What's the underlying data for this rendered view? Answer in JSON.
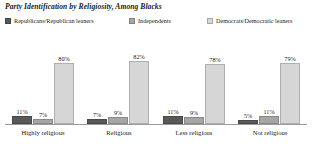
{
  "chart_data": {
    "type": "bar",
    "title": "Party Identification by Religiosity, Among Blacks",
    "xlabel": "",
    "ylabel": "",
    "ylim": [
      0,
      100
    ],
    "grid": false,
    "legend_position": "top",
    "categories": [
      "Highly religious",
      "Religious",
      "Less religious",
      "Not religious"
    ],
    "series": [
      {
        "name": "Republicans/Republican leaners",
        "color": "#595959",
        "values": [
          11,
          7,
          11,
          5
        ],
        "labels": [
          "11%",
          "7%",
          "11%",
          "5%"
        ]
      },
      {
        "name": "Independents",
        "color": "#a6a6a6",
        "values": [
          7,
          9,
          9,
          11
        ],
        "labels": [
          "7%",
          "9%",
          "9%",
          "11%"
        ]
      },
      {
        "name": "Democrats/Democratic leaners",
        "color": "#d6d6d6",
        "values": [
          80,
          82,
          78,
          79
        ],
        "labels": [
          "80%",
          "82%",
          "78%",
          "79%"
        ]
      }
    ]
  },
  "legend": {
    "items": [
      {
        "label": "Republicans/Republican leaners",
        "color": "#595959"
      },
      {
        "label": "Independents",
        "color": "#a6a6a6"
      },
      {
        "label": "Democrats/Democratic leaners",
        "color": "#d6d6d6"
      }
    ]
  },
  "axis": {
    "baseline_color": "#9b9b9b"
  }
}
